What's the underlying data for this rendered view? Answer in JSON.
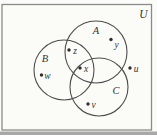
{
  "figure": {
    "type": "venn-diagram",
    "universe": {
      "label": "U",
      "label_pos": {
        "x": 143.5,
        "y": 14
      }
    },
    "frame": {
      "x": 2,
      "y": 4.5,
      "width": 149.5,
      "height": 125.5
    },
    "bottom_band": {
      "x": 0,
      "y": 131.5,
      "width": 157,
      "height": 3.5
    },
    "sets": [
      {
        "label": "A",
        "cx": 96,
        "cy": 52,
        "r": 31,
        "label_pos": {
          "x": 96,
          "y": 30
        }
      },
      {
        "label": "B",
        "cx": 64,
        "cy": 70,
        "r": 30,
        "label_pos": {
          "x": 45,
          "y": 58
        }
      },
      {
        "label": "C",
        "cx": 99,
        "cy": 87,
        "r": 29,
        "label_pos": {
          "x": 116,
          "y": 90
        }
      }
    ],
    "elements": [
      {
        "label": "y",
        "dot": {
          "x": 111,
          "y": 39.5
        },
        "label_pos": {
          "x": 116.5,
          "y": 44.5
        },
        "region": "A only"
      },
      {
        "label": "z",
        "dot": {
          "x": 69,
          "y": 50
        },
        "label_pos": {
          "x": 75,
          "y": 51
        },
        "region": "A and B only"
      },
      {
        "label": "x",
        "dot": {
          "x": 80,
          "y": 68
        },
        "label_pos": {
          "x": 86,
          "y": 68.5
        },
        "region": "A and B and C"
      },
      {
        "label": "w",
        "dot": {
          "x": 41.5,
          "y": 75
        },
        "label_pos": {
          "x": 47.5,
          "y": 76
        },
        "region": "B only"
      },
      {
        "label": "u",
        "dot": {
          "x": 130,
          "y": 68
        },
        "label_pos": {
          "x": 136,
          "y": 69
        },
        "region": "U outside A B C"
      },
      {
        "label": "v",
        "dot": {
          "x": 88,
          "y": 104
        },
        "label_pos": {
          "x": 93.5,
          "y": 105
        },
        "region": "C only"
      }
    ],
    "colors": {
      "paper": "#fbfbf8",
      "frame_stroke": "#8a8a8a",
      "circle_stroke": "#4d4d4d",
      "text": "#333333",
      "dot": "#2f2f2f",
      "bottom_band": "#a8a8a8"
    }
  }
}
